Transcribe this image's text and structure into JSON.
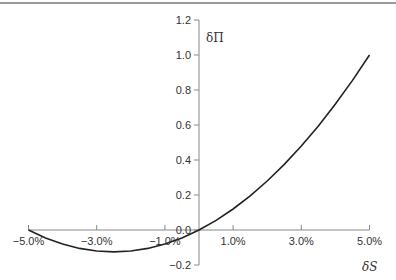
{
  "chart_data": {
    "type": "line",
    "title": "",
    "xlabel": "δS",
    "ylabel": "δΠ",
    "xlim": [
      -5.0,
      5.0
    ],
    "ylim": [
      -0.2,
      1.2
    ],
    "grid": false,
    "legend": null,
    "x_ticks": [
      -5.0,
      -3.0,
      -1.0,
      1.0,
      3.0,
      5.0
    ],
    "x_tick_labels": [
      "−5.0%",
      "−3.0%",
      "−1.0%",
      "1.0%",
      "3.0%",
      "5.0%"
    ],
    "y_ticks": [
      -0.2,
      0.0,
      0.2,
      0.4,
      0.6,
      0.8,
      1.0,
      1.2
    ],
    "y_tick_labels": [
      "−0.2",
      "0.0",
      "0.2",
      "0.4",
      "0.6",
      "0.8",
      "1.0",
      "1.2"
    ],
    "series": [
      {
        "name": "δΠ vs δS",
        "x": [
          -5.0,
          -4.5,
          -4.0,
          -3.5,
          -3.0,
          -2.5,
          -2.0,
          -1.5,
          -1.0,
          -0.5,
          0.0,
          0.5,
          1.0,
          1.5,
          2.0,
          2.5,
          3.0,
          3.5,
          4.0,
          4.5,
          5.0
        ],
        "y": [
          0.0,
          -0.045,
          -0.08,
          -0.105,
          -0.12,
          -0.125,
          -0.12,
          -0.105,
          -0.08,
          -0.045,
          0.0,
          0.055,
          0.12,
          0.195,
          0.28,
          0.375,
          0.48,
          0.595,
          0.72,
          0.855,
          1.0
        ],
        "color": "#222222"
      }
    ]
  },
  "colors": {
    "axis": "#888888",
    "curve": "#222222",
    "text": "#333333",
    "top_rule": "#777777"
  }
}
